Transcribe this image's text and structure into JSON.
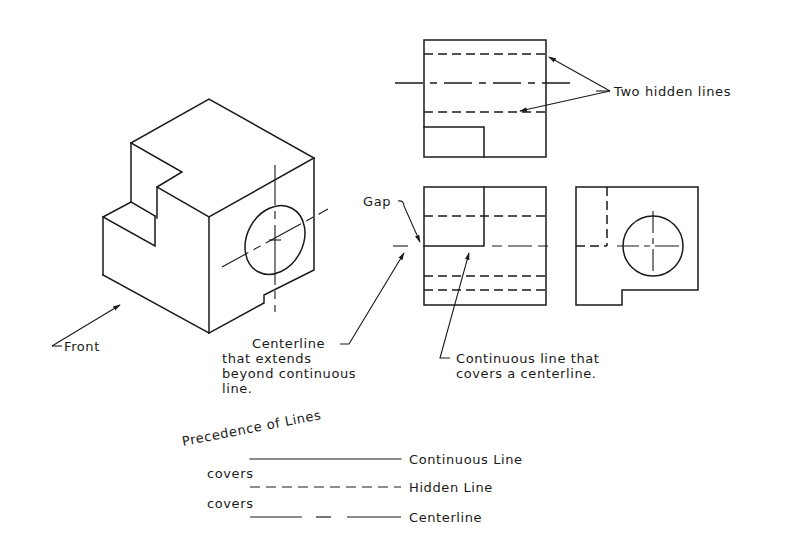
{
  "diagram": {
    "title": "Precedence of Lines",
    "isometric_view": {
      "label": "Front"
    },
    "top_view": {
      "annotation": "Two hidden lines"
    },
    "front_view": {
      "gap_label": "Gap",
      "centerline_note": [
        "Centerline",
        "that extends",
        "beyond continuous",
        "line."
      ],
      "continuous_note": [
        "Continuous line that",
        "covers a centerline."
      ]
    },
    "side_view": {},
    "legend": {
      "title": "Precedence of Lines",
      "rows": [
        {
          "line_type": "continuous",
          "label": "Continuous Line"
        },
        {
          "connector": "covers"
        },
        {
          "line_type": "hidden",
          "label": "Hidden Line"
        },
        {
          "connector": "covers"
        },
        {
          "line_type": "centerline",
          "label": "Centerline"
        }
      ]
    }
  },
  "colors": {
    "ink": "#1a1a1a",
    "paper": "#ffffff"
  }
}
